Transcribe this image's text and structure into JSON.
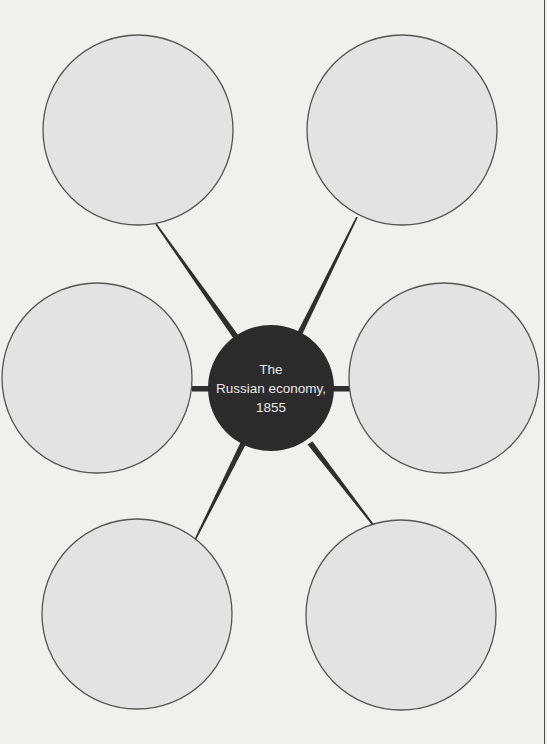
{
  "diagram": {
    "type": "spider-diagram",
    "colors": {
      "background": "#f0f0ef",
      "outer_fill": "#e3e3e3",
      "outer_stroke": "#555555",
      "hub_fill": "#2b2b2b",
      "connector": "#2e2e2e",
      "hub_text": "#e8e8e8"
    },
    "hub": {
      "label_lines": [
        "The",
        "Russian economy,",
        "1855"
      ],
      "cx": 271,
      "cy": 388,
      "r": 63
    },
    "nodes": [
      {
        "id": "top-left",
        "label": "",
        "cx": 138,
        "cy": 130,
        "r": 95
      },
      {
        "id": "top-right",
        "label": "",
        "cx": 402,
        "cy": 130,
        "r": 95
      },
      {
        "id": "middle-left",
        "label": "",
        "cx": 97,
        "cy": 378,
        "r": 95
      },
      {
        "id": "middle-right",
        "label": "",
        "cx": 444,
        "cy": 378,
        "r": 95
      },
      {
        "id": "bottom-left",
        "label": "",
        "cx": 137,
        "cy": 614,
        "r": 95
      },
      {
        "id": "bottom-right",
        "label": "",
        "cx": 401,
        "cy": 615,
        "r": 95
      }
    ]
  }
}
